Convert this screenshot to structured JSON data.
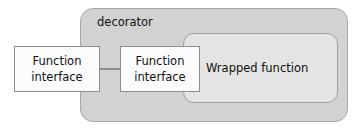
{
  "diagram": {
    "outer_container": {
      "label": "decorator"
    },
    "inner_container": {
      "label": "Wrapped function"
    },
    "interface_boxes": [
      {
        "id": "outer-interface",
        "line1": "Function",
        "line2": "interface"
      },
      {
        "id": "inner-interface",
        "line1": "Function",
        "line2": "interface"
      }
    ],
    "connector": {
      "label": "connector-line"
    },
    "colors": {
      "page_background": "#ffffff",
      "decorator_fill": "#d2d2d2",
      "decorator_stroke": "#a8a8a8",
      "wrapped_fill": "#e4e4e4",
      "wrapped_stroke": "#a0a0a0",
      "interface_fill": "#fbfbfb",
      "interface_stroke": "#8e8e8e",
      "text": "#111111"
    }
  }
}
